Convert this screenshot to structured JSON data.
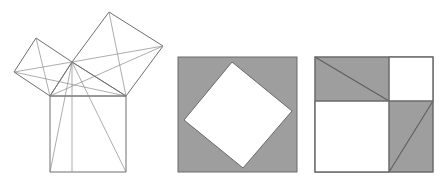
{
  "figure": {
    "title": "Pythagorean theorem proof diagram",
    "background_color": "#ffffff",
    "stroke_color": "#5a5a5a",
    "fill_gray": "#9e9e9e",
    "fill_white": "#ffffff",
    "width": 448,
    "height": 184,
    "panels": [
      {
        "id": "panel-left",
        "name": "pythagoras-squares-on-triangle",
        "caption": "",
        "description": "Right triangle with squares erected on each of its three sides, plus construction lines from the right-angle vertex"
      },
      {
        "id": "panel-middle",
        "name": "tilted-square-in-square",
        "caption": "",
        "description": "Gray outer square containing a tilted white square (c-squared), leaving four gray right triangles"
      },
      {
        "id": "panel-right",
        "name": "two-squares-in-square",
        "caption": "",
        "description": "Gray outer square containing two white squares (a-squared and b-squared) and four gray right triangles"
      }
    ]
  },
  "chart_data": {
    "type": "diagram",
    "panel_left": {
      "label": "squares on the sides of a right triangle",
      "triangle": {
        "apex_right_angle": [
          72,
          62
        ],
        "base_left": [
          50,
          96
        ],
        "base_right": [
          126,
          96
        ]
      },
      "square_hypotenuse": [
        [
          50,
          96
        ],
        [
          126,
          96
        ],
        [
          126,
          172
        ],
        [
          50,
          172
        ]
      ],
      "square_leg_long": [
        [
          72,
          62
        ],
        [
          126,
          96
        ],
        [
          163,
          46
        ],
        [
          109,
          12
        ]
      ],
      "square_leg_short": [
        [
          72,
          62
        ],
        [
          50,
          96
        ],
        [
          14,
          72
        ],
        [
          36,
          38
        ]
      ],
      "construction_lines": [
        [
          [
            72,
            62
          ],
          [
            72,
            172
          ]
        ],
        [
          [
            72,
            62
          ],
          [
            50,
            172
          ]
        ],
        [
          [
            72,
            62
          ],
          [
            126,
            172
          ]
        ],
        [
          [
            72,
            62
          ],
          [
            163,
            46
          ]
        ],
        [
          [
            72,
            62
          ],
          [
            14,
            72
          ]
        ],
        [
          [
            50,
            96
          ],
          [
            163,
            46
          ]
        ],
        [
          [
            14,
            72
          ],
          [
            126,
            96
          ]
        ],
        [
          [
            109,
            12
          ],
          [
            126,
            96
          ]
        ],
        [
          [
            36,
            38
          ],
          [
            50,
            96
          ]
        ]
      ]
    },
    "panel_middle": {
      "label": "c squared plus four triangles",
      "outer_square": [
        [
          178,
          57
        ],
        [
          297,
          57
        ],
        [
          297,
          172
        ],
        [
          178,
          172
        ]
      ],
      "inner_tilted_square": [
        [
          232,
          62
        ],
        [
          292,
          111
        ],
        [
          243,
          168
        ],
        [
          184,
          120
        ]
      ],
      "gray_area": "four congruent right triangles in the corners",
      "white_area": "tilted square of side c"
    },
    "panel_right": {
      "label": "a squared plus b squared plus four triangles",
      "outer_square": [
        [
          315,
          57
        ],
        [
          433,
          57
        ],
        [
          433,
          172
        ],
        [
          315,
          172
        ]
      ],
      "vertical_divider_x": 389,
      "horizontal_divider_y": 101,
      "white_square_large": [
        [
          315,
          101
        ],
        [
          389,
          101
        ],
        [
          389,
          172
        ],
        [
          315,
          172
        ]
      ],
      "white_square_small": [
        [
          389,
          57
        ],
        [
          433,
          57
        ],
        [
          433,
          101
        ],
        [
          389,
          101
        ]
      ],
      "gray_region_top_left": [
        [
          315,
          57
        ],
        [
          389,
          57
        ],
        [
          389,
          101
        ],
        [
          315,
          101
        ]
      ],
      "gray_region_bottom_right": [
        [
          389,
          101
        ],
        [
          433,
          101
        ],
        [
          433,
          172
        ],
        [
          389,
          172
        ]
      ],
      "diagonal_top_left": [
        [
          315,
          57
        ],
        [
          389,
          101
        ]
      ],
      "diagonal_bottom_right": [
        [
          389,
          172
        ],
        [
          433,
          101
        ]
      ]
    }
  }
}
